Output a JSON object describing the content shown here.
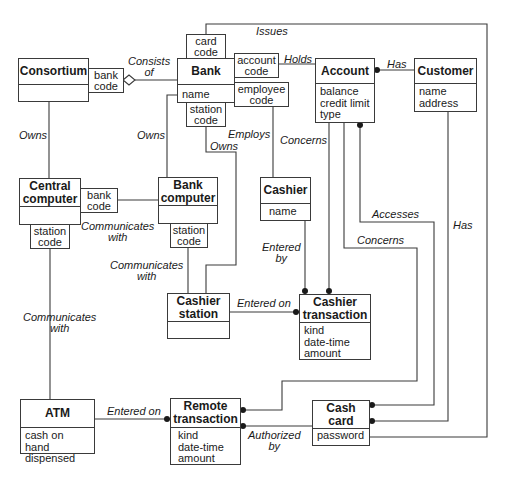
{
  "diagram": {
    "type": "OMT class diagram",
    "classes": {
      "consortium": {
        "name": "Consortium",
        "attributes": ""
      },
      "bank": {
        "name": "Bank",
        "attributes": "name"
      },
      "account": {
        "name": "Account",
        "attributes": "balance\ncredit limit\ntype"
      },
      "customer": {
        "name": "Customer",
        "attributes": "name\naddress"
      },
      "central_computer": {
        "name": "Central\ncomputer",
        "attributes": ""
      },
      "bank_computer": {
        "name": "Bank\ncomputer",
        "attributes": ""
      },
      "cashier": {
        "name": "Cashier",
        "attributes": "name"
      },
      "cashier_station": {
        "name": "Cashier\nstation",
        "attributes": ""
      },
      "cashier_transaction": {
        "name": "Cashier\ntransaction",
        "attributes": "kind\ndate-time\namount"
      },
      "atm": {
        "name": "ATM",
        "attributes": "cash on hand\ndispensed"
      },
      "remote_transaction": {
        "name": "Remote\ntransaction",
        "attributes": "kind\ndate-time\namount"
      },
      "cash_card": {
        "name": "Cash\ncard",
        "attributes": "password"
      }
    },
    "qualifiers": {
      "consortium_bank_code": "bank\ncode",
      "bank_card_code": "card\ncode",
      "bank_account_code": "account\ncode",
      "bank_employee_code": "employee\ncode",
      "bank_station_code": "station\ncode",
      "central_bank_code": "bank\ncode",
      "central_station_code": "station\ncode",
      "bankcomputer_station_code": "station\ncode"
    },
    "associations": {
      "consists_of": "Consists\nof",
      "issues": "Issues",
      "holds": "Holds",
      "has_account": "Has",
      "owns_central": "Owns",
      "owns_bank_computer": "Owns",
      "owns_station": "Owns",
      "employs": "Employs",
      "concerns_cashier_tx": "Concerns",
      "accesses": "Accesses",
      "concerns_remote_tx": "Concerns",
      "has_card": "Has",
      "communicates_central_bank": "Communicates\nwith",
      "communicates_bank_station": "Communicates\nwith",
      "communicates_central_atm": "Communicates\nwith",
      "entered_by": "Entered\nby",
      "entered_on_station": "Entered on",
      "entered_on_atm": "Entered on",
      "authorized_by": "Authorized\nby"
    }
  }
}
